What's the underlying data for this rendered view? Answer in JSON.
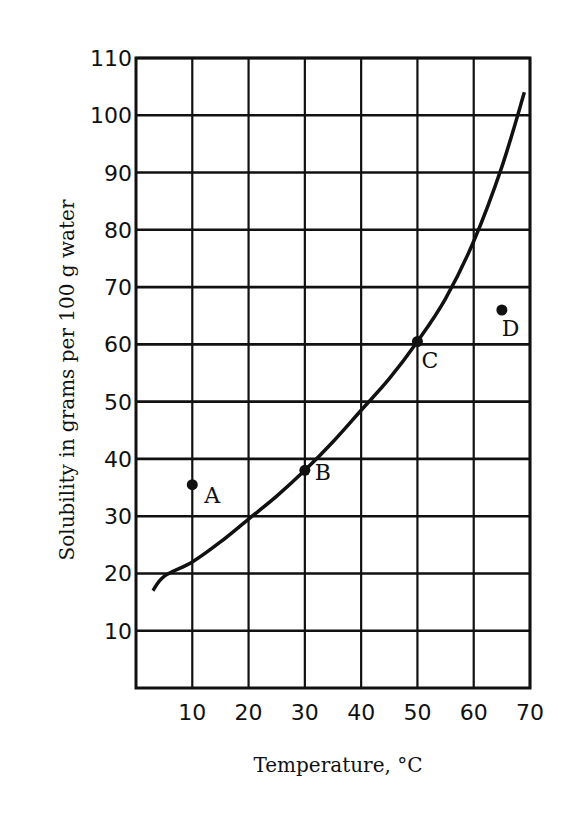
{
  "chart_data": {
    "type": "line",
    "title": "",
    "xlabel": "Temperature, °C",
    "ylabel": "Solubility in grams per 100 g water",
    "xlim": [
      0,
      70
    ],
    "ylim": [
      0,
      110
    ],
    "grid": true,
    "x_ticks": [
      10,
      20,
      30,
      40,
      50,
      60,
      70
    ],
    "y_ticks": [
      10,
      20,
      30,
      40,
      50,
      60,
      70,
      80,
      90,
      100,
      110
    ],
    "series": [
      {
        "name": "solubility curve",
        "x": [
          0,
          5,
          10,
          15,
          20,
          25,
          30,
          35,
          40,
          45,
          50,
          55,
          60,
          65,
          69
        ],
        "values": [
          17,
          19.5,
          22,
          25.5,
          29.5,
          33.5,
          38,
          43,
          48.5,
          54,
          60.5,
          68,
          78,
          91,
          104
        ]
      }
    ],
    "points": [
      {
        "label": "A",
        "x": 10,
        "y": 35.5
      },
      {
        "label": "B",
        "x": 30,
        "y": 38
      },
      {
        "label": "C",
        "x": 50,
        "y": 60.5
      },
      {
        "label": "D",
        "x": 65,
        "y": 66
      }
    ]
  },
  "axes": {
    "x_title": "Temperature, °C",
    "y_title": "Solubility in grams per 100 g water"
  }
}
